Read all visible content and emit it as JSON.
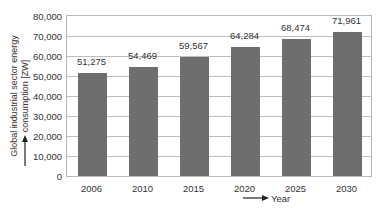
{
  "chart_data": {
    "type": "bar",
    "title": "",
    "categories": [
      "2006",
      "2010",
      "2015",
      "2020",
      "2025",
      "2030"
    ],
    "values": [
      51275,
      54469,
      59567,
      64284,
      68474,
      71961
    ],
    "value_labels": [
      "51,275",
      "54,469",
      "59,567",
      "64,284",
      "68,474",
      "71,961"
    ],
    "xlabel": "Year",
    "ylabel": "Global industrial sector energy consumption [ZW]",
    "ylim": [
      0,
      80000
    ],
    "yticks": [
      "0",
      "10,000",
      "20,000",
      "30,000",
      "40,000",
      "50,000",
      "60,000",
      "70,000",
      "80,000"
    ],
    "grid": true,
    "legend": "none",
    "bar_color": "#6e6e6e"
  }
}
